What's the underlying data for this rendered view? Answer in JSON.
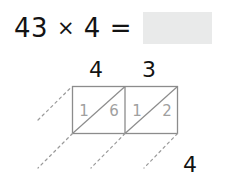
{
  "equation": {
    "left_factor": "43",
    "operator": "×",
    "right_factor": "4",
    "equals": "=",
    "answer_value": "",
    "answer_box_color": "#e9eaea"
  },
  "lattice": {
    "column_labels": [
      "4",
      "3"
    ],
    "row_label": "4",
    "grid_line_color": "#8c8c8c",
    "digit_color": "#a0a0a0",
    "cells": [
      {
        "tens": "1",
        "ones": "6"
      },
      {
        "tens": "1",
        "ones": "2"
      }
    ]
  }
}
